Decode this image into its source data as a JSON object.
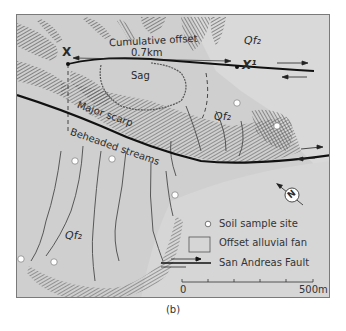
{
  "figure": {
    "caption": "(b)",
    "colors": {
      "background": "#cfcfcf",
      "fan": "#d8d8d8",
      "hatch": "#555555",
      "fault_line": "#111111",
      "stream": "#4a4a4a",
      "sample_site": "#ffffff",
      "frame": "#7a7a7a"
    }
  },
  "labels": {
    "point_x": "X",
    "point_x_prime": "X¹",
    "cumulative_offset_line1": "Cumulative offset",
    "cumulative_offset_line2": "0.7km",
    "sag": "Sag",
    "major_scarp": "Major scarp",
    "beheaded_streams": "Beheaded streams",
    "qf2_top_right": "Qf₂",
    "qf2_middle": "Qf₂",
    "qf2_bottom_left": "Qf₂"
  },
  "compass": {
    "letter": "N",
    "icon": "north-arrow-icon"
  },
  "legend": {
    "items": [
      {
        "symbol": "circle",
        "label": "Soil sample site"
      },
      {
        "symbol": "box",
        "label": "Offset alluvial fan"
      },
      {
        "symbol": "fault-arrows",
        "label": "San Andreas Fault"
      }
    ]
  },
  "scale_bar": {
    "start_label": "0",
    "end_label": "500m",
    "ticks": 6
  },
  "sample_sites": [
    {
      "x": 236,
      "y": 102
    },
    {
      "x": 276,
      "y": 125
    },
    {
      "x": 74,
      "y": 160
    },
    {
      "x": 111,
      "y": 158
    },
    {
      "x": 174,
      "y": 194
    },
    {
      "x": 20,
      "y": 258
    },
    {
      "x": 53,
      "y": 261
    }
  ]
}
